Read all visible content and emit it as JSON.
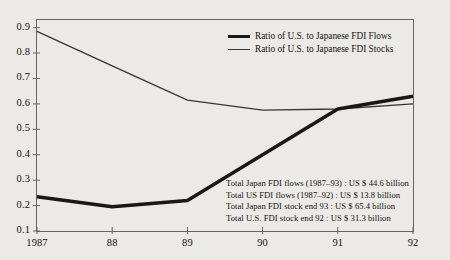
{
  "chart_data": {
    "type": "line",
    "title": "",
    "xlabel": "",
    "ylabel": "",
    "x": [
      1987,
      1988,
      1989,
      1990,
      1991,
      1992
    ],
    "xtick_labels": [
      "1987",
      "88",
      "89",
      "90",
      "91",
      "92"
    ],
    "ytick_labels": [
      "0.1",
      "0.2",
      "0.3",
      "0.4",
      "0.5",
      "0.6",
      "0.7",
      "0.8",
      "0.9"
    ],
    "ytick_values": [
      0.1,
      0.2,
      0.3,
      0.4,
      0.5,
      0.6,
      0.7,
      0.8,
      0.9
    ],
    "ylim": [
      0.1,
      0.93
    ],
    "xlim": [
      1987,
      1992
    ],
    "grid": false,
    "legend_position": "top-right-inside",
    "series": [
      {
        "name": "Ratio of U.S. to Japanese FDI Flows",
        "style": "thick",
        "color": "#1b1714",
        "values": [
          0.235,
          0.195,
          0.22,
          0.4,
          0.58,
          0.63
        ]
      },
      {
        "name": "Ratio of U.S. to Japanese FDI Stocks",
        "style": "thin",
        "color": "#3a352f",
        "values": [
          0.885,
          0.75,
          0.615,
          0.575,
          0.58,
          0.6
        ]
      }
    ],
    "annotations": [
      "Total Japan FDI flows  (1987–93) : US $ 44.6 billion",
      "Total US FDI flows (1987–92) : US $ 13.8 billion",
      "Total Japan FDI stock end 93 : US $ 65.4 billion",
      "Total U.S. FDI stock end 92 : US $ 31.3 billion"
    ]
  },
  "colors": {
    "background": "#eceae6",
    "axis": "#5c564e",
    "text": "#15120f",
    "flows_line": "#1b1714",
    "stocks_line": "#3a352f"
  }
}
